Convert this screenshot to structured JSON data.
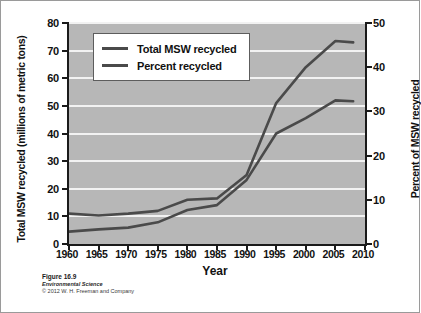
{
  "chart_data": {
    "type": "line",
    "title": "",
    "xlabel": "Year",
    "ylabel": "Total MSW recycled (millions of metric tons)",
    "y2label": "Percent of MSW recycled",
    "xlim": [
      1960,
      2010
    ],
    "ylim": [
      0,
      80
    ],
    "y2lim": [
      0,
      50
    ],
    "grid": true,
    "legend_position": "upper left",
    "x": [
      1960,
      1965,
      1970,
      1975,
      1980,
      1985,
      1990,
      1995,
      2000,
      2005,
      2008
    ],
    "xticks": [
      1960,
      1965,
      1970,
      1975,
      1980,
      1985,
      1990,
      1995,
      2000,
      2005,
      2010
    ],
    "yticks": [
      0,
      10,
      20,
      30,
      40,
      50,
      60,
      70,
      80
    ],
    "y2ticks": [
      0,
      10,
      20,
      30,
      40,
      50
    ],
    "series": [
      {
        "name": "Total MSW recycled",
        "axis": "left",
        "units": "millions of metric tons",
        "values": [
          11.0,
          10.3,
          11.0,
          12.0,
          16.0,
          16.5,
          25.0,
          51.0,
          64.0,
          73.5,
          73.0
        ]
      },
      {
        "name": "Percent recycled",
        "axis": "right",
        "units": "percent",
        "values": [
          2.8,
          3.3,
          3.7,
          4.9,
          7.7,
          8.8,
          14.5,
          25.0,
          28.5,
          32.5,
          32.3
        ]
      }
    ],
    "colors": {
      "series_line": "#4a4a4a",
      "plot_background": "#b7b7b7",
      "gridline": "#f2f2f2",
      "axis": "#1a1a1a"
    }
  },
  "legend": {
    "items": [
      {
        "label": "Total MSW recycled"
      },
      {
        "label": "Percent recycled"
      }
    ]
  },
  "caption": {
    "figure_number": "Figure 16.9",
    "book_title": "Environmental Science",
    "copyright": "© 2012 W. H. Freeman and Company"
  }
}
